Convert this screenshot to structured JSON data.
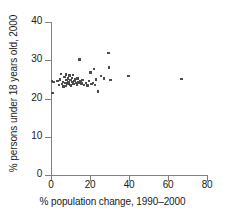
{
  "chart_data": {
    "type": "scatter",
    "title": "",
    "xlabel": "% population change, 1990–2000",
    "ylabel": "% persons under 18 years old, 2000",
    "xlim": [
      0,
      80
    ],
    "ylim": [
      0,
      40
    ],
    "xticks": [
      0,
      20,
      40,
      60,
      80
    ],
    "yticks": [
      0,
      10,
      20,
      30,
      40
    ],
    "xtick_labels": [
      "0",
      "20",
      "40",
      "60",
      "80"
    ],
    "ytick_labels": [
      "0",
      "10",
      "20",
      "30",
      "40"
    ],
    "grid": false,
    "legend": null,
    "marker": "square",
    "marker_color": "#4d4d4d",
    "axis_color": "#808080",
    "points": [
      [
        0.6,
        24.6
      ],
      [
        0.8,
        21.4
      ],
      [
        1.2,
        24.3
      ],
      [
        3.4,
        24.6
      ],
      [
        4.2,
        23.6
      ],
      [
        4.6,
        25.0
      ],
      [
        5.2,
        26.4
      ],
      [
        5.6,
        23.8
      ],
      [
        6.0,
        24.4
      ],
      [
        6.4,
        23.2
      ],
      [
        6.8,
        25.6
      ],
      [
        7.0,
        24.0
      ],
      [
        7.4,
        23.3
      ],
      [
        7.8,
        26.3
      ],
      [
        8.0,
        24.8
      ],
      [
        8.4,
        23.9
      ],
      [
        8.6,
        25.2
      ],
      [
        9.0,
        24.2
      ],
      [
        9.4,
        26.0
      ],
      [
        9.6,
        23.6
      ],
      [
        10.0,
        24.9
      ],
      [
        10.3,
        23.4
      ],
      [
        10.6,
        25.4
      ],
      [
        11.0,
        24.3
      ],
      [
        11.4,
        26.2
      ],
      [
        11.6,
        23.8
      ],
      [
        12.0,
        24.6
      ],
      [
        12.4,
        25.0
      ],
      [
        12.8,
        24.0
      ],
      [
        13.2,
        23.5
      ],
      [
        13.6,
        25.2
      ],
      [
        14.0,
        24.2
      ],
      [
        14.6,
        30.2
      ],
      [
        15.0,
        24.5
      ],
      [
        15.6,
        23.9
      ],
      [
        16.2,
        24.8
      ],
      [
        17.0,
        23.6
      ],
      [
        17.8,
        24.1
      ],
      [
        18.6,
        23.4
      ],
      [
        19.4,
        24.6
      ],
      [
        20.2,
        26.8
      ],
      [
        20.8,
        23.8
      ],
      [
        21.4,
        24.0
      ],
      [
        22.0,
        27.7
      ],
      [
        22.6,
        23.6
      ],
      [
        23.2,
        25.0
      ],
      [
        24.0,
        21.8
      ],
      [
        25.6,
        25.9
      ],
      [
        27.0,
        25.2
      ],
      [
        29.4,
        31.9
      ],
      [
        29.8,
        28.1
      ],
      [
        30.4,
        24.9
      ],
      [
        39.8,
        25.9
      ],
      [
        66.8,
        25.1
      ]
    ]
  }
}
